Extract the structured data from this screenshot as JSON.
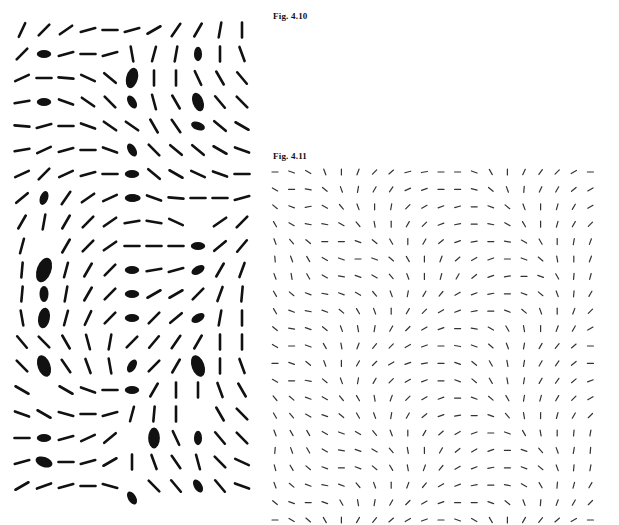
{
  "figures": {
    "fig_4_10": {
      "label": "Fig. 4.10"
    },
    "fig_4_11": {
      "label": "Fig. 4.11"
    }
  },
  "left_field": {
    "description": "Orientation field with singular point markers (blobs)",
    "origin": [
      22,
      30
    ],
    "spacing": [
      22,
      24
    ],
    "stick_length": 15,
    "stick_width": 2.6,
    "color": "#111111",
    "angles": [
      [
        65,
        45,
        35,
        15,
        0,
        15,
        30,
        55,
        60,
        80,
        90
      ],
      [
        45,
        null,
        15,
        0,
        15,
        -80,
        75,
        80,
        null,
        90,
        -70
      ],
      [
        25,
        0,
        -5,
        -25,
        -40,
        null,
        90,
        90,
        -65,
        -60,
        -50
      ],
      [
        10,
        null,
        -20,
        -35,
        -45,
        null,
        -75,
        -60,
        null,
        -50,
        -45
      ],
      [
        -5,
        15,
        0,
        -20,
        -35,
        -35,
        -60,
        -55,
        null,
        -40,
        -30
      ],
      [
        10,
        25,
        15,
        0,
        -20,
        null,
        -45,
        -40,
        -40,
        -30,
        -20
      ],
      [
        25,
        45,
        25,
        15,
        0,
        null,
        -40,
        -30,
        -25,
        -20,
        0
      ],
      [
        40,
        null,
        55,
        35,
        25,
        null,
        -20,
        -5,
        0,
        0,
        15
      ],
      [
        60,
        80,
        60,
        45,
        35,
        10,
        -10,
        -25,
        null,
        35,
        45
      ],
      [
        75,
        null,
        60,
        45,
        35,
        0,
        0,
        0,
        null,
        40,
        50
      ],
      [
        85,
        null,
        75,
        60,
        45,
        null,
        10,
        15,
        null,
        60,
        70
      ],
      [
        85,
        null,
        80,
        60,
        45,
        null,
        30,
        30,
        45,
        70,
        85
      ],
      [
        -80,
        null,
        75,
        65,
        45,
        null,
        45,
        40,
        null,
        80,
        90
      ],
      [
        -50,
        -45,
        -60,
        -75,
        80,
        45,
        50,
        55,
        60,
        90,
        90
      ],
      [
        -45,
        null,
        -55,
        -70,
        -80,
        null,
        45,
        60,
        null,
        90,
        -70
      ],
      [
        -30,
        null,
        -30,
        -20,
        0,
        null,
        60,
        90,
        90,
        -70,
        -60
      ],
      [
        -20,
        -30,
        -15,
        0,
        15,
        75,
        85,
        90,
        null,
        -60,
        -45
      ],
      [
        0,
        null,
        15,
        25,
        40,
        null,
        85,
        -65,
        null,
        -50,
        -45
      ],
      [
        15,
        null,
        0,
        15,
        30,
        90,
        -70,
        -55,
        -75,
        -45,
        -25
      ],
      [
        30,
        20,
        15,
        0,
        -15,
        null,
        -45,
        -50,
        null,
        -50,
        -20
      ]
    ],
    "blobs": [
      [
        1,
        1,
        0,
        0.9
      ],
      [
        1,
        8,
        90,
        0.9
      ],
      [
        2,
        5,
        75,
        1.3
      ],
      [
        3,
        1,
        0,
        0.9
      ],
      [
        3,
        5,
        -60,
        0.9
      ],
      [
        3,
        8,
        -70,
        1.2
      ],
      [
        4,
        8,
        -20,
        0.9
      ],
      [
        5,
        5,
        -60,
        0.9
      ],
      [
        6,
        5,
        0,
        0.9
      ],
      [
        7,
        1,
        70,
        0.9
      ],
      [
        7,
        5,
        0,
        0.9
      ],
      [
        7,
        5.1,
        0,
        0.8
      ],
      [
        9,
        8,
        0,
        0.9
      ],
      [
        10,
        1,
        70,
        1.6
      ],
      [
        10,
        5,
        0,
        0.9
      ],
      [
        10,
        8,
        30,
        0.9
      ],
      [
        11,
        1,
        90,
        1.0
      ],
      [
        11,
        5,
        0,
        0.9
      ],
      [
        12,
        1,
        80,
        1.3
      ],
      [
        12,
        5,
        0,
        0.9
      ],
      [
        12,
        8,
        30,
        0.9
      ],
      [
        14,
        1,
        -70,
        1.4
      ],
      [
        14,
        5,
        60,
        0.9
      ],
      [
        14,
        8,
        -70,
        1.4
      ],
      [
        15,
        5,
        0,
        0.9
      ],
      [
        17,
        1,
        0,
        0.9
      ],
      [
        17,
        6,
        90,
        1.3
      ],
      [
        17,
        8,
        90,
        0.9
      ],
      [
        18,
        1,
        -20,
        1.1
      ],
      [
        19,
        8,
        -60,
        0.9
      ],
      [
        19.5,
        5,
        -60,
        0.9
      ]
    ]
  },
  "right_field": {
    "description": "Fine orientation field, 20x20 grid",
    "origin": [
      275,
      172
    ],
    "spacing": [
      16.6,
      17.4
    ],
    "stick_length": 6,
    "stick_width": 1.2,
    "color": "#333333",
    "angles": [
      [
        0,
        -20,
        -30,
        -70,
        90,
        70,
        45,
        40,
        15,
        10,
        0,
        0,
        -20,
        -60,
        90,
        65,
        55,
        45,
        30,
        0
      ],
      [
        -30,
        0,
        -10,
        -40,
        -70,
        80,
        60,
        55,
        25,
        20,
        0,
        0,
        -15,
        -40,
        -70,
        85,
        65,
        60,
        40,
        30
      ],
      [
        -40,
        -20,
        10,
        -30,
        -50,
        -70,
        90,
        80,
        45,
        30,
        20,
        15,
        0,
        -20,
        -40,
        -70,
        90,
        75,
        60,
        30
      ],
      [
        -60,
        -30,
        -10,
        -10,
        -30,
        -50,
        -80,
        90,
        60,
        45,
        20,
        10,
        0,
        -10,
        -30,
        -60,
        90,
        75,
        60,
        45
      ],
      [
        -70,
        -50,
        -40,
        0,
        0,
        -20,
        -40,
        -60,
        90,
        60,
        40,
        20,
        10,
        0,
        -10,
        -30,
        -60,
        90,
        80,
        70
      ],
      [
        -85,
        -70,
        -60,
        -30,
        -20,
        0,
        -20,
        -40,
        -60,
        90,
        70,
        40,
        30,
        20,
        0,
        -20,
        -40,
        -80,
        90,
        70
      ],
      [
        -70,
        -80,
        -60,
        -30,
        -10,
        -20,
        -30,
        -50,
        -70,
        90,
        75,
        60,
        40,
        20,
        10,
        0,
        -20,
        -60,
        85,
        75
      ],
      [
        -60,
        -40,
        -20,
        -10,
        -20,
        -30,
        -50,
        -70,
        80,
        60,
        50,
        30,
        20,
        10,
        0,
        -20,
        -40,
        -70,
        85,
        60
      ],
      [
        -60,
        -20,
        -10,
        -20,
        -40,
        -60,
        -70,
        90,
        60,
        45,
        30,
        20,
        10,
        0,
        -20,
        -40,
        -70,
        90,
        70,
        45
      ],
      [
        -40,
        -10,
        -20,
        -40,
        -70,
        -80,
        80,
        60,
        45,
        30,
        20,
        0,
        -10,
        -30,
        -60,
        -80,
        90,
        70,
        60,
        30
      ],
      [
        -30,
        0,
        -20,
        -60,
        -80,
        70,
        50,
        45,
        30,
        20,
        0,
        -10,
        -20,
        -40,
        -70,
        80,
        60,
        50,
        40,
        0
      ],
      [
        0,
        -20,
        -40,
        -70,
        90,
        60,
        45,
        30,
        20,
        10,
        0,
        -20,
        -40,
        -60,
        -80,
        80,
        60,
        55,
        40,
        0
      ],
      [
        -30,
        0,
        -10,
        -40,
        -70,
        80,
        60,
        45,
        30,
        20,
        0,
        -20,
        -40,
        -60,
        -80,
        80,
        60,
        55,
        40,
        20
      ],
      [
        -50,
        -40,
        -20,
        -30,
        -50,
        -60,
        -80,
        70,
        45,
        30,
        20,
        0,
        -20,
        -40,
        -60,
        80,
        75,
        60,
        45,
        30
      ],
      [
        -60,
        -50,
        -30,
        -20,
        -40,
        -60,
        -70,
        80,
        60,
        40,
        20,
        10,
        0,
        -20,
        -50,
        -80,
        90,
        75,
        60,
        45
      ],
      [
        -70,
        -60,
        -60,
        -30,
        -20,
        -30,
        -50,
        -70,
        90,
        60,
        40,
        30,
        20,
        0,
        -20,
        -60,
        -80,
        90,
        85,
        80
      ],
      [
        85,
        -70,
        -60,
        -30,
        -10,
        -20,
        -30,
        -50,
        -80,
        90,
        60,
        40,
        30,
        20,
        0,
        -20,
        -50,
        -70,
        80,
        85
      ],
      [
        -75,
        -60,
        -40,
        -20,
        0,
        -20,
        -40,
        -60,
        -80,
        70,
        50,
        30,
        20,
        10,
        0,
        -20,
        -40,
        -70,
        85,
        80
      ],
      [
        -70,
        -40,
        -20,
        -10,
        -20,
        -50,
        -70,
        90,
        70,
        50,
        30,
        20,
        10,
        0,
        -10,
        -30,
        -60,
        85,
        75,
        60
      ],
      [
        -40,
        -20,
        0,
        -20,
        -60,
        -80,
        80,
        60,
        45,
        30,
        20,
        0,
        0,
        -20,
        -40,
        -70,
        85,
        70,
        60,
        45
      ],
      [
        0,
        -30,
        -40,
        -60,
        90,
        60,
        50,
        40,
        30,
        20,
        0,
        -20,
        -30,
        -60,
        90,
        60,
        50,
        40,
        30,
        0
      ]
    ]
  }
}
